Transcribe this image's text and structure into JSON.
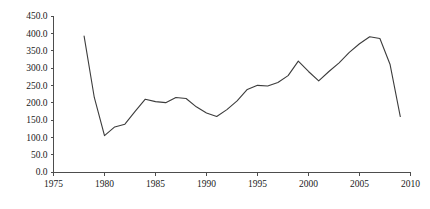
{
  "chart_data": {
    "type": "line",
    "title": "",
    "subtitle": "",
    "xlabel": "",
    "ylabel": "",
    "xlim": [
      1975,
      2010
    ],
    "ylim": [
      0,
      450
    ],
    "grid": false,
    "legend": false,
    "legend_position": "none",
    "x_ticks": [
      1975,
      1980,
      1985,
      1990,
      1995,
      2000,
      2005,
      2010
    ],
    "x_tick_labels": [
      "1975",
      "1980",
      "1985",
      "1990",
      "1995",
      "2000",
      "2005",
      "2010"
    ],
    "y_ticks": [
      0,
      50,
      100,
      150,
      200,
      250,
      300,
      350,
      400,
      450
    ],
    "y_tick_labels": [
      "0.0",
      "50.0",
      "100.0",
      "150.0",
      "200.0",
      "250.0",
      "300.0",
      "350.0",
      "400.0",
      "450.0"
    ],
    "line_color": "#3c3c3c",
    "axis_color": "#4d4d4d",
    "x": [
      1978,
      1979,
      1980,
      1981,
      1982,
      1983,
      1984,
      1985,
      1986,
      1987,
      1988,
      1989,
      1990,
      1991,
      1992,
      1993,
      1994,
      1995,
      1996,
      1997,
      1998,
      1999,
      2000,
      2001,
      2002,
      2003,
      2004,
      2005,
      2006,
      2007,
      2008,
      2009
    ],
    "values": [
      392,
      215,
      105,
      130,
      138,
      175,
      210,
      203,
      200,
      215,
      212,
      188,
      170,
      160,
      180,
      205,
      238,
      250,
      248,
      258,
      278,
      320,
      290,
      263,
      290,
      315,
      345,
      370,
      390,
      385,
      310,
      160
    ],
    "series": [
      {
        "name": "series-1",
        "values": [
          392,
          215,
          105,
          130,
          138,
          175,
          210,
          203,
          200,
          215,
          212,
          188,
          170,
          160,
          180,
          205,
          238,
          250,
          248,
          258,
          278,
          320,
          290,
          263,
          290,
          315,
          345,
          370,
          390,
          385,
          310,
          160
        ]
      }
    ]
  }
}
